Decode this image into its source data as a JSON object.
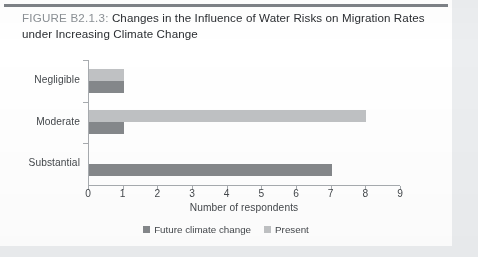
{
  "figure": {
    "number_label": "FIGURE B2.1.3:",
    "title": "Changes in the Influence of Water Risks on Migration Rates under Increasing Climate Change"
  },
  "colors": {
    "present": "#c0c2c4",
    "future": "#85888b",
    "axis": "#a7abaf",
    "text": "#44484c",
    "rule": "#7d8287",
    "figure_number": "#8b9095"
  },
  "legend": {
    "items": [
      {
        "label": "Future climate change",
        "color": "#85888b"
      },
      {
        "label": "Present",
        "color": "#c0c2c4"
      }
    ]
  },
  "chart_data": {
    "type": "bar",
    "orientation": "horizontal",
    "title": "Changes in the Influence of Water Risks on Migration Rates under Increasing Climate Change",
    "categories": [
      "Negligible",
      "Moderate",
      "Substantial"
    ],
    "series": [
      {
        "name": "Present",
        "values": [
          1,
          8,
          0
        ],
        "color": "#c0c2c4"
      },
      {
        "name": "Future climate change",
        "values": [
          1,
          1,
          7
        ],
        "color": "#85888b"
      }
    ],
    "xlabel": "Number of respondents",
    "ylabel": "",
    "xlim": [
      0,
      9
    ],
    "xticks": [
      0,
      1,
      2,
      3,
      4,
      5,
      6,
      7,
      8,
      9
    ],
    "xtick_labels": [
      "0",
      "1",
      "2",
      "3",
      "4",
      "5",
      "6",
      "7",
      "8",
      "9"
    ],
    "grid": false,
    "legend_position": "bottom"
  }
}
